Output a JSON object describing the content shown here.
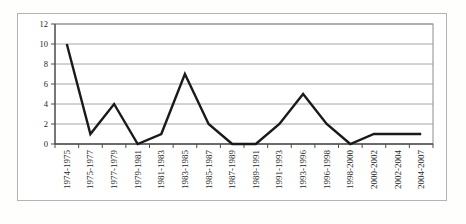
{
  "chart_data": {
    "type": "line",
    "title": "",
    "xlabel": "",
    "ylabel": "",
    "categories": [
      "1974-1975",
      "1975-1977",
      "1977-1979",
      "1979-1981",
      "1981-1983",
      "1983-1985",
      "1985-1987",
      "1987-1989",
      "1989-1991",
      "1991-1993",
      "1993-1996",
      "1996-1998",
      "1998-2000",
      "2000-2002",
      "2002-2004",
      "2004-2007"
    ],
    "values": [
      10,
      1,
      4,
      0,
      1,
      7,
      2,
      0,
      0,
      2,
      5,
      2,
      0,
      1,
      1,
      1
    ],
    "ylim": [
      0,
      12
    ],
    "yticks": [
      0,
      2,
      4,
      6,
      8,
      10,
      12
    ],
    "grid": "horizontal",
    "legend": "none",
    "colors": {
      "series_line": "#1a1a1a",
      "gridline": "#a6a6a6",
      "plot_border": "#8c8c8c",
      "axis": "#4d4d4d",
      "tick": "#4d4d4d",
      "label_text": "#262626",
      "frame_border": "#b3b3b3",
      "background": "#ffffff"
    }
  }
}
